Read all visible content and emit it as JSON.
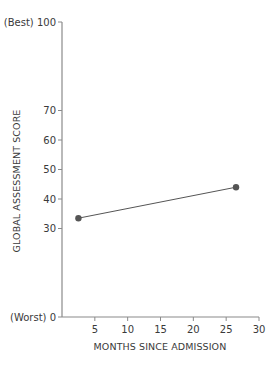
{
  "chart_data": {
    "type": "line",
    "title": "",
    "xlabel": "MONTHS SINCE ADMISSION",
    "ylabel": "GLOBAL ASSESSMENT SCORE",
    "xlim": [
      0,
      30
    ],
    "ylim": [
      0,
      100
    ],
    "x_ticks": [
      5,
      10,
      15,
      20,
      25,
      30
    ],
    "y_ticks": [
      {
        "value": 0,
        "label": "(Worst) 0"
      },
      {
        "value": 30,
        "label": "30"
      },
      {
        "value": 40,
        "label": "40"
      },
      {
        "value": 50,
        "label": "50"
      },
      {
        "value": 60,
        "label": "60"
      },
      {
        "value": 70,
        "label": "70"
      },
      {
        "value": 100,
        "label": "(Best) 100"
      }
    ],
    "grid": false,
    "legend": null,
    "series": [
      {
        "name": "Global assessment score",
        "x": [
          2.5,
          26.5
        ],
        "y": [
          33.5,
          44
        ],
        "color": "#555555",
        "marker": "circle"
      }
    ]
  }
}
